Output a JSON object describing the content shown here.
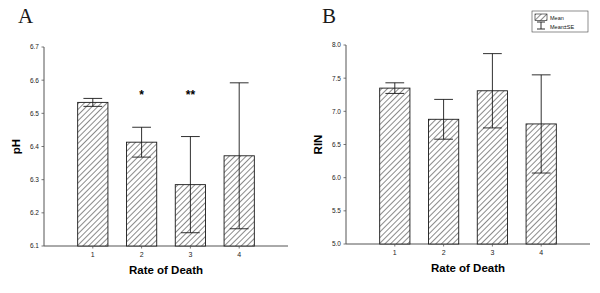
{
  "figure": {
    "panels": [
      {
        "letter": "A",
        "chart_ref": 0
      },
      {
        "letter": "B",
        "chart_ref": 1
      }
    ],
    "legend": {
      "title": "",
      "entries": [
        {
          "label": "Mean",
          "marker": "hatched-box"
        },
        {
          "label": "Mean±SE",
          "marker": "error-bar"
        }
      ]
    }
  },
  "chart_data": [
    {
      "type": "bar",
      "panel": "A",
      "title": "",
      "xlabel": "Rate of Death",
      "ylabel": "pH",
      "categories": [
        "1",
        "2",
        "3",
        "4"
      ],
      "values": [
        6.533,
        6.413,
        6.285,
        6.372
      ],
      "errors": [
        0.012,
        0.045,
        0.145,
        0.22
      ],
      "error_type": "SE",
      "annotations": [
        "",
        "*",
        "**",
        ""
      ],
      "ylim": [
        6.1,
        6.7
      ],
      "yticks": [
        6.1,
        6.2,
        6.3,
        6.4,
        6.5,
        6.6,
        6.7
      ],
      "ytick_labels": [
        "6.1",
        "6.2",
        "6.3",
        "6.4",
        "6.5",
        "6.6",
        "6.7"
      ],
      "grid": false,
      "legend_position": "none"
    },
    {
      "type": "bar",
      "panel": "B",
      "title": "",
      "xlabel": "Rate of Death",
      "ylabel": "RIN",
      "categories": [
        "1",
        "2",
        "3",
        "4"
      ],
      "values": [
        7.35,
        6.88,
        7.31,
        6.81
      ],
      "errors": [
        0.08,
        0.3,
        0.56,
        0.74
      ],
      "error_type": "SE",
      "annotations": [
        "",
        "",
        "",
        ""
      ],
      "ylim": [
        5.0,
        8.0
      ],
      "yticks": [
        5.0,
        5.5,
        6.0,
        6.5,
        7.0,
        7.5,
        8.0
      ],
      "ytick_labels": [
        "5.0",
        "5.5",
        "6.0",
        "6.5",
        "7.0",
        "7.5",
        "8.0"
      ],
      "grid": false,
      "legend_position": "top-right"
    }
  ],
  "style": {
    "bar_fill": "#ffffff",
    "bar_edge": "#1a1a1a",
    "hatch": "diagonal-forward",
    "axis_color": "#555555",
    "text_color": "#111111"
  }
}
